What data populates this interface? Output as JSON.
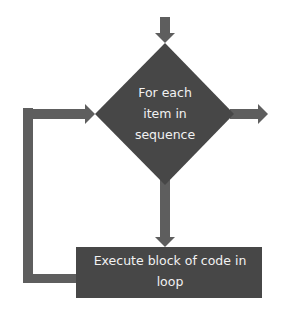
{
  "diagram": {
    "type": "flowchart",
    "colors": {
      "shape_fill": "#474747",
      "arrow_fill": "#5e5e5e",
      "text": "#f2f2f2",
      "background": "#ffffff"
    },
    "nodes": [
      {
        "id": "decision",
        "shape": "diamond",
        "label": "For each item in sequence",
        "lines": [
          "For each",
          "item in",
          "sequence"
        ]
      },
      {
        "id": "process",
        "shape": "rectangle",
        "label": "Execute block of code in loop",
        "lines": [
          "Execute block of code in",
          "loop"
        ]
      }
    ],
    "edges": [
      {
        "from": "start",
        "to": "decision",
        "direction": "down"
      },
      {
        "from": "decision",
        "to": "process",
        "direction": "down"
      },
      {
        "from": "process",
        "to": "decision",
        "direction": "loop-back-left"
      },
      {
        "from": "decision",
        "to": "exit",
        "direction": "right"
      }
    ]
  }
}
